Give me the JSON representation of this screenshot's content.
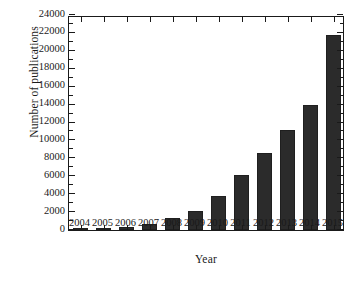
{
  "chart_data": {
    "type": "bar",
    "title": "",
    "xlabel": "Year",
    "ylabel": "Number of publications",
    "categories": [
      "2004",
      "2005",
      "2006",
      "2007",
      "2008",
      "2009",
      "2010",
      "2011",
      "2012",
      "2013",
      "2014",
      "2015"
    ],
    "values": [
      100,
      180,
      290,
      700,
      1350,
      2150,
      3750,
      6100,
      8650,
      11150,
      13950,
      21800
    ],
    "series": [
      {
        "name": "Number of publications",
        "values": [
          100,
          180,
          290,
          700,
          1350,
          2150,
          3750,
          6100,
          8650,
          11150,
          13950,
          21800
        ]
      }
    ],
    "ylim": [
      0,
      24000
    ],
    "ytick_labels": [
      "0",
      "2000",
      "4000",
      "6000",
      "8000",
      "10000",
      "12000",
      "14000",
      "16000",
      "18000",
      "20000",
      "22000",
      "24000"
    ],
    "ytick_values": [
      0,
      2000,
      4000,
      6000,
      8000,
      10000,
      12000,
      14000,
      16000,
      18000,
      20000,
      22000,
      24000
    ],
    "ytick_step": 2000,
    "xtick_labels": [
      "2004",
      "2005",
      "2006",
      "2007",
      "2008",
      "2009",
      "2010",
      "2011",
      "2012",
      "2013",
      "2014",
      "2015"
    ],
    "grid": false,
    "legend": false,
    "legend_position": "none",
    "bar_color": "#2b2b2b",
    "axis_color": "#1a1a1a",
    "background_color": "#ffffff"
  }
}
